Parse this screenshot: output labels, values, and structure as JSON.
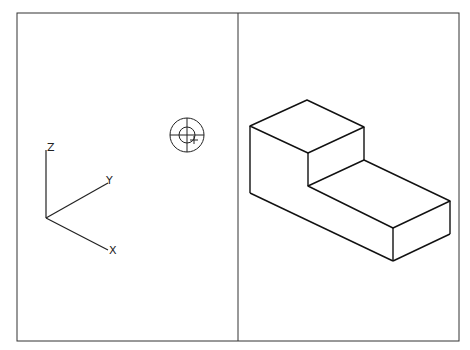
{
  "canvas": {
    "width": 470,
    "height": 350,
    "background": "#ffffff",
    "stroke": "#1a1a1a"
  },
  "viewports": [
    {
      "name": "left-viewport",
      "content": "ucs-axis-icon-and-target-cursor"
    },
    {
      "name": "right-viewport",
      "content": "isometric-stepped-block"
    }
  ],
  "axis_icon": {
    "labels": {
      "z": "Z",
      "y": "Y",
      "x": "X"
    }
  },
  "cursor": {
    "icon": "target-crosshair-icon"
  },
  "model": {
    "description": "isometric L-shaped stepped block"
  }
}
